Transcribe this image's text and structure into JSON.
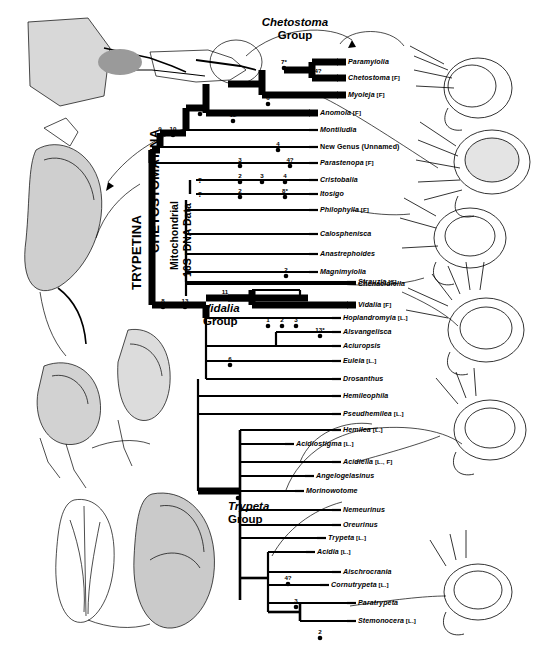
{
  "figure": {
    "title_groups": [
      {
        "id": "chetostoma-group",
        "italic": "Chetostoma",
        "roman": "Group"
      },
      {
        "id": "vidalia-group",
        "italic": "Vidalia",
        "roman": "Group"
      },
      {
        "id": "trypeta-group",
        "italic": "Trypeta",
        "roman": "Group"
      }
    ],
    "vertical_labels": {
      "trypetina": "TRYPETINA",
      "chetostomatina": "CHETOSTOMATINA",
      "data_line1": "Mitochondrial",
      "data_line2": "16S rDNA Data"
    }
  },
  "chart_data": {
    "type": "diagram",
    "subtype": "cladogram",
    "taxa": [
      {
        "name": "Paramyiolia",
        "code": "",
        "y": 62,
        "x": 338,
        "thick": true
      },
      {
        "name": "Chetostoma",
        "code": "[F]",
        "y": 78,
        "x": 338,
        "thick": true
      },
      {
        "name": "Myoleja",
        "code": "[F]",
        "y": 95,
        "x": 338,
        "thick": true
      },
      {
        "name": "Anomoia",
        "code": "[F]",
        "y": 113,
        "x": 310,
        "thick": true
      },
      {
        "name": "Montiludia",
        "code": "",
        "y": 130,
        "x": 310,
        "thick": false
      },
      {
        "name": "New Genus (Unnamed)",
        "code": "",
        "y": 147,
        "x": 310,
        "thick": false,
        "plain": true
      },
      {
        "name": "Parastenopa",
        "code": "[F]",
        "y": 163,
        "x": 310,
        "thick": false
      },
      {
        "name": "Cristobalia",
        "code": "",
        "y": 180,
        "x": 310,
        "thick": false
      },
      {
        "name": "Itosigo",
        "code": "",
        "y": 194,
        "x": 310,
        "thick": false
      },
      {
        "name": "Philophylla",
        "code": "[F]",
        "y": 210,
        "x": 310,
        "thick": false
      },
      {
        "name": "Calosphenisca",
        "code": "",
        "y": 234,
        "x": 310,
        "thick": false
      },
      {
        "name": "Anastrephoides",
        "code": "",
        "y": 254,
        "x": 310,
        "thick": false
      },
      {
        "name": "Magnimyiolia",
        "code": "",
        "y": 272,
        "x": 310,
        "thick": false
      },
      {
        "name": "Strauzia",
        "code": "[S]",
        "y": 282,
        "x": 348,
        "thick": false
      },
      {
        "name": "Chenacidiella",
        "code": "",
        "y": 284,
        "x": 348,
        "thick": false
      },
      {
        "name": "Vidalia",
        "code": "[F]",
        "y": 305,
        "x": 348,
        "thick": true
      },
      {
        "name": "Hoplandromyia",
        "code": "[L.]",
        "y": 318,
        "x": 333,
        "thick": false
      },
      {
        "name": "Alsvangelisca",
        "code": "",
        "y": 332,
        "x": 333,
        "thick": false
      },
      {
        "name": "Aciuropsis",
        "code": "",
        "y": 346,
        "x": 333,
        "thick": false
      },
      {
        "name": "Euleia",
        "code": "[L.]",
        "y": 361,
        "x": 333,
        "thick": false
      },
      {
        "name": "Drosanthus",
        "code": "",
        "y": 379,
        "x": 333,
        "thick": false
      },
      {
        "name": "Hemileophila",
        "code": "",
        "y": 396,
        "x": 333,
        "thick": false
      },
      {
        "name": "Pseudhemilea",
        "code": "[L.]",
        "y": 414,
        "x": 333,
        "thick": false
      },
      {
        "name": "Hemilea",
        "code": "[L.]",
        "y": 430,
        "x": 333,
        "thick": false
      },
      {
        "name": "Acidiostigma",
        "code": "[L.]",
        "y": 444,
        "x": 286,
        "thick": false
      },
      {
        "name": "Acidiella",
        "code": "[L., F]",
        "y": 462,
        "x": 333,
        "thick": false
      },
      {
        "name": "Angelogelasinus",
        "code": "",
        "y": 476,
        "x": 306,
        "thick": false
      },
      {
        "name": "Morinowotome",
        "code": "",
        "y": 491,
        "x": 296,
        "thick": false
      },
      {
        "name": "Nemeurinus",
        "code": "",
        "y": 510,
        "x": 333,
        "thick": false
      },
      {
        "name": "Oreurinus",
        "code": "",
        "y": 525,
        "x": 333,
        "thick": false
      },
      {
        "name": "Trypeta",
        "code": "[L.]",
        "y": 538,
        "x": 318,
        "thick": false
      },
      {
        "name": "Acidia",
        "code": "[L.]",
        "y": 552,
        "x": 307,
        "thick": false
      },
      {
        "name": "Aischrocrania",
        "code": "",
        "y": 572,
        "x": 333,
        "thick": false
      },
      {
        "name": "Cornutrypeta",
        "code": "[L.]",
        "y": 585,
        "x": 321,
        "thick": false
      },
      {
        "name": "Paratrypeta",
        "code": "",
        "y": 603,
        "x": 348,
        "thick": false
      },
      {
        "name": "Stemonocera",
        "code": "[L.]",
        "y": 621,
        "x": 348,
        "thick": false
      }
    ],
    "node_numbers": [
      {
        "label": "7*",
        "x": 284,
        "y": 58
      },
      {
        "label": "4?",
        "x": 318,
        "y": 67
      },
      {
        "label": "6",
        "x": 268,
        "y": 94
      },
      {
        "label": "12",
        "x": 233,
        "y": 111
      },
      {
        "label": "7",
        "x": 200,
        "y": 104
      },
      {
        "label": "9",
        "x": 160,
        "y": 125
      },
      {
        "label": "10",
        "x": 173,
        "y": 125
      },
      {
        "label": "4",
        "x": 278,
        "y": 140
      },
      {
        "label": "3",
        "x": 240,
        "y": 156
      },
      {
        "label": "4?",
        "x": 290,
        "y": 156
      },
      {
        "label": "2",
        "x": 240,
        "y": 172
      },
      {
        "label": "3",
        "x": 262,
        "y": 172
      },
      {
        "label": "4",
        "x": 285,
        "y": 172
      },
      {
        "label": "2",
        "x": 240,
        "y": 187
      },
      {
        "label": "8*",
        "x": 285,
        "y": 187
      },
      {
        "label": "2",
        "x": 286,
        "y": 266
      },
      {
        "label": "11",
        "x": 225,
        "y": 288
      },
      {
        "label": "8",
        "x": 163,
        "y": 297
      },
      {
        "label": "13",
        "x": 185,
        "y": 297
      },
      {
        "label": "1",
        "x": 268,
        "y": 316
      },
      {
        "label": "2",
        "x": 282,
        "y": 316
      },
      {
        "label": "3",
        "x": 296,
        "y": 316
      },
      {
        "label": "13*",
        "x": 320,
        "y": 326
      },
      {
        "label": "6",
        "x": 230,
        "y": 355
      },
      {
        "label": "5",
        "x": 238,
        "y": 488
      },
      {
        "label": "4?",
        "x": 288,
        "y": 574
      },
      {
        "label": "3",
        "x": 296,
        "y": 597
      },
      {
        "label": "2",
        "x": 320,
        "y": 628
      }
    ],
    "question_marks": [
      {
        "label": "?",
        "x": 200,
        "y": 180
      },
      {
        "label": "?",
        "x": 200,
        "y": 194
      }
    ]
  }
}
